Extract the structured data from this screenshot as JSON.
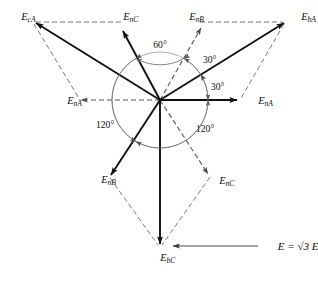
{
  "figure": {
    "type": "phasor-diagram",
    "origin": {
      "x": 160,
      "y": 100
    },
    "circle_radius": 48,
    "caption": {
      "text": "E = √3 E",
      "subscript": "n",
      "full": "E = √3 Eₙ",
      "leader_from": {
        "x": 258,
        "y": 246
      },
      "leader_to": {
        "x": 172,
        "y": 246
      }
    },
    "colors": {
      "solid": "#111111",
      "dashed": "#555555",
      "arc": "#888888",
      "text": "#111111",
      "background": "#ffffff"
    },
    "labels": {
      "e_ca": {
        "base": "E",
        "sub": "cA"
      },
      "e_nc_top": {
        "base": "E",
        "sub": "nC"
      },
      "e_nb_top": {
        "base": "E",
        "sub": "nB"
      },
      "e_ba": {
        "base": "E",
        "sub": "bA"
      },
      "e_na_left": {
        "base": "E",
        "sub": "nA"
      },
      "e_na_right": {
        "base": "E",
        "sub": "nA"
      },
      "e_nb_bottom": {
        "base": "E",
        "sub": "nB"
      },
      "e_nc_bottom": {
        "base": "E",
        "sub": "nC"
      },
      "e_bc": {
        "base": "E",
        "sub": "bC"
      }
    },
    "angles": [
      {
        "id": "angle-60",
        "value": "60°",
        "x": 160,
        "y": 45
      },
      {
        "id": "angle-30-upper",
        "value": "30°",
        "x": 207,
        "y": 60
      },
      {
        "id": "angle-30-lower",
        "value": "30°",
        "x": 213,
        "y": 88
      },
      {
        "id": "angle-120-left",
        "value": "120°",
        "x": 99,
        "y": 124
      },
      {
        "id": "angle-120-right",
        "value": "120°",
        "x": 196,
        "y": 128
      }
    ],
    "phasors": [
      {
        "name": "E_nA",
        "style": "solid",
        "angle_deg": 0,
        "tip": {
          "x": 238,
          "y": 100
        }
      },
      {
        "name": "E_nC",
        "style": "solid",
        "angle_deg": 120,
        "tip": {
          "x": 122,
          "y": 30
        }
      },
      {
        "name": "E_nB",
        "style": "solid",
        "angle_deg": 240,
        "tip": {
          "x": 110,
          "y": 176
        }
      },
      {
        "name": "E_nA_reversed",
        "style": "dashed",
        "angle_deg": 180,
        "tip": {
          "x": 78,
          "y": 100
        }
      },
      {
        "name": "E_nB_reversed",
        "style": "dashed",
        "angle_deg": 60,
        "tip": {
          "x": 200,
          "y": 27
        }
      },
      {
        "name": "E_nC_reversed",
        "style": "dashed",
        "angle_deg": 300,
        "tip": {
          "x": 209,
          "y": 175
        }
      },
      {
        "name": "E_bA",
        "style": "solid",
        "tip": {
          "x": 285,
          "y": 22
        }
      },
      {
        "name": "E_cA",
        "style": "solid",
        "tip": {
          "x": 34,
          "y": 22
        }
      },
      {
        "name": "E_bC",
        "style": "solid",
        "tip": {
          "x": 160,
          "y": 245
        }
      }
    ]
  }
}
